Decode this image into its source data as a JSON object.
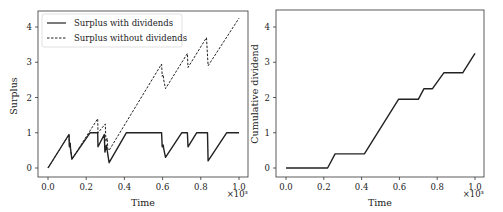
{
  "chart_data": [
    {
      "type": "line",
      "title": "",
      "xlabel": "Time",
      "ylabel": "Surplus",
      "x_scale_note": "×10³",
      "xlim": [
        0,
        1000
      ],
      "ylim": [
        -0.15,
        4.4
      ],
      "xticks": [
        "0.0",
        "0.2",
        "0.4",
        "0.6",
        "0.8",
        "1.0"
      ],
      "yticks": [
        "0",
        "1",
        "2",
        "3",
        "4"
      ],
      "grid": false,
      "legend_position": "upper left",
      "series": [
        {
          "name": "Surplus with dividends",
          "style": "solid",
          "points": [
            [
              0,
              0
            ],
            [
              110,
              0.95
            ],
            [
              112,
              0.6
            ],
            [
              116,
              0.7
            ],
            [
              118,
              0.55
            ],
            [
              125,
              0.25
            ],
            [
              220,
              1.0
            ],
            [
              260,
              1.0
            ],
            [
              262,
              0.6
            ],
            [
              295,
              0.95
            ],
            [
              298,
              0.45
            ],
            [
              306,
              0.65
            ],
            [
              310,
              0.5
            ],
            [
              320,
              0.15
            ],
            [
              410,
              1.0
            ],
            [
              595,
              1.0
            ],
            [
              598,
              0.6
            ],
            [
              603,
              0.65
            ],
            [
              606,
              0.55
            ],
            [
              615,
              0.3
            ],
            [
              700,
              1.0
            ],
            [
              730,
              1.0
            ],
            [
              733,
              0.6
            ],
            [
              778,
              1.0
            ],
            [
              835,
              1.0
            ],
            [
              838,
              0.2
            ],
            [
              935,
              1.0
            ],
            [
              1000,
              1.0
            ]
          ]
        },
        {
          "name": "Surplus without dividends",
          "style": "dashed",
          "points": [
            [
              0,
              0
            ],
            [
              110,
              0.95
            ],
            [
              112,
              0.6
            ],
            [
              116,
              0.7
            ],
            [
              118,
              0.55
            ],
            [
              125,
              0.25
            ],
            [
              260,
              1.4
            ],
            [
              262,
              1.0
            ],
            [
              300,
              1.25
            ],
            [
              303,
              0.75
            ],
            [
              310,
              0.85
            ],
            [
              313,
              0.55
            ],
            [
              320,
              0.5
            ],
            [
              595,
              2.95
            ],
            [
              598,
              2.6
            ],
            [
              603,
              2.65
            ],
            [
              606,
              2.5
            ],
            [
              615,
              2.25
            ],
            [
              730,
              3.25
            ],
            [
              733,
              2.85
            ],
            [
              830,
              3.7
            ],
            [
              838,
              2.9
            ],
            [
              1000,
              4.25
            ]
          ]
        }
      ]
    },
    {
      "type": "line",
      "title": "",
      "xlabel": "Time",
      "ylabel": "Cumulative dividend",
      "x_scale_note": "×10³",
      "xlim": [
        0,
        1000
      ],
      "ylim": [
        -0.15,
        4.4
      ],
      "xticks": [
        "0.0",
        "0.2",
        "0.4",
        "0.6",
        "0.8",
        "1.0"
      ],
      "yticks": [
        "0",
        "1",
        "2",
        "3",
        "4"
      ],
      "grid": false,
      "series": [
        {
          "name": "Cumulative dividend",
          "style": "solid",
          "points": [
            [
              0,
              0
            ],
            [
              220,
              0
            ],
            [
              260,
              0.4
            ],
            [
              415,
              0.4
            ],
            [
              595,
              1.95
            ],
            [
              700,
              1.95
            ],
            [
              730,
              2.25
            ],
            [
              775,
              2.25
            ],
            [
              835,
              2.7
            ],
            [
              935,
              2.7
            ],
            [
              1000,
              3.25
            ]
          ]
        }
      ]
    }
  ]
}
